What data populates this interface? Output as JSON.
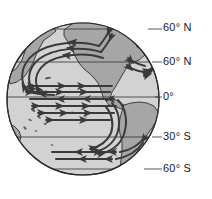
{
  "figure": {
    "kind": "globe-map",
    "projection": "orthographic globe centered on the Pacific Ocean",
    "colors": {
      "ocean": "#d2d2d2",
      "land": "#a6a6a6",
      "outline": "#2b2b2b",
      "current_arrow": "#3a3a3a",
      "latitude_line": "#3a3a3a",
      "label_text": "#1a1a1a",
      "background": "#ffffff"
    }
  },
  "globe": {
    "center_x": 83,
    "center_y": 99,
    "radius": 76
  },
  "latitude_labels": [
    {
      "id": "lat-60n-upper",
      "text": "60° N",
      "x": 160,
      "y": 21,
      "line_y": 29
    },
    {
      "id": "lat-60n-lower",
      "text": "60° N",
      "x": 160,
      "y": 55,
      "line_y": 62
    },
    {
      "id": "lat-0",
      "text": "0°",
      "x": 160,
      "y": 90,
      "line_y": 97
    },
    {
      "id": "lat-30s",
      "text": "30° S",
      "x": 160,
      "y": 130,
      "line_y": 137
    },
    {
      "id": "lat-60s",
      "text": "60° S",
      "x": 160,
      "y": 162,
      "line_y": 169
    }
  ],
  "landmasses": [
    {
      "name": "north-america",
      "label": "North America"
    },
    {
      "name": "south-america",
      "label": "South America"
    },
    {
      "name": "asia-east-edge",
      "label": "Asia (eastern edge)"
    },
    {
      "name": "australia-edge",
      "label": "Australia (eastern edge)"
    },
    {
      "name": "antarctica",
      "label": "Antarctica"
    },
    {
      "name": "pacific-islands",
      "label": "Pacific islands"
    }
  ],
  "currents": [
    {
      "name": "north-pacific-gyre",
      "direction": "clockwise",
      "region": "North Pacific"
    },
    {
      "name": "south-pacific-gyre",
      "direction": "counterclockwise",
      "region": "South Pacific"
    },
    {
      "name": "north-equatorial",
      "direction": "westward",
      "region": "Equatorial"
    },
    {
      "name": "south-equatorial",
      "direction": "westward",
      "region": "Equatorial"
    },
    {
      "name": "equatorial-counter",
      "direction": "eastward",
      "region": "Equatorial"
    },
    {
      "name": "antarctic-circumpolar",
      "direction": "eastward",
      "region": "Southern Ocean"
    },
    {
      "name": "atlantic-gyre-edge",
      "direction": "clockwise",
      "region": "North Atlantic edge"
    }
  ]
}
